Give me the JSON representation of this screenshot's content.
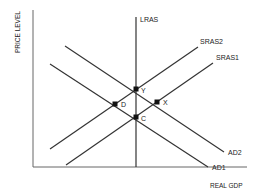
{
  "diagram": {
    "type": "AD-AS model",
    "axes": {
      "y_label": "PRICE LEVEL",
      "x_label": "REAL GDP"
    },
    "curves": [
      {
        "id": "lras",
        "label": "LRAS",
        "kind": "vertical"
      },
      {
        "id": "sras2",
        "label": "SRAS2",
        "kind": "upward"
      },
      {
        "id": "sras1",
        "label": "SRAS1",
        "kind": "upward"
      },
      {
        "id": "ad2",
        "label": "AD2",
        "kind": "downward"
      },
      {
        "id": "ad1",
        "label": "AD1",
        "kind": "downward"
      }
    ],
    "points": [
      {
        "id": "Y",
        "label": "Y"
      },
      {
        "id": "D",
        "label": "D"
      },
      {
        "id": "X",
        "label": "X"
      },
      {
        "id": "C",
        "label": "C"
      }
    ],
    "colors": {
      "line": "#333333",
      "axis": "#555555",
      "point": "#111111"
    }
  }
}
